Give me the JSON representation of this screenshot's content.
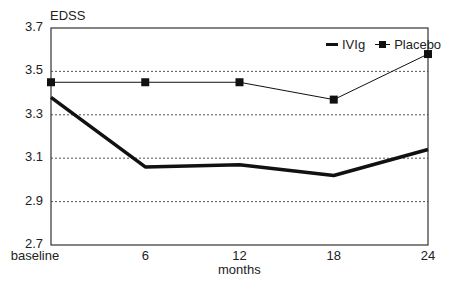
{
  "chart_data": {
    "type": "line",
    "title": "",
    "xlabel": "months",
    "ylabel": "EDSS",
    "categories": [
      "baseline",
      "6",
      "12",
      "18",
      "24"
    ],
    "series": [
      {
        "name": "IVIg",
        "values": [
          3.38,
          3.06,
          3.07,
          3.02,
          3.14
        ],
        "style": "thick line, no markers",
        "color": "#111111"
      },
      {
        "name": "Placebo",
        "values": [
          3.45,
          3.45,
          3.45,
          3.37,
          3.58
        ],
        "style": "thin line, square markers",
        "color": "#111111"
      }
    ],
    "ylim": [
      2.7,
      3.7
    ],
    "yticks": [
      "3.7",
      "3.5",
      "3.3",
      "3.1",
      "2.9",
      "2.7"
    ],
    "grid": {
      "horizontal": true,
      "style": "dotted"
    },
    "legend_position": "top-right inside"
  },
  "labels": {
    "ylabel": "EDSS",
    "xlabel": "months",
    "legend_ivig": "IVIg",
    "legend_placebo": "Placebo"
  }
}
